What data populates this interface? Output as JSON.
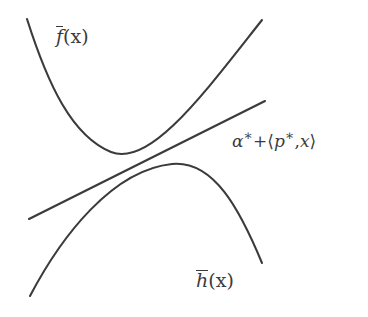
{
  "figure": {
    "background_color": "#ffffff",
    "stroke_color": "#3b3b3b",
    "stroke_width": 2.1,
    "labels": {
      "upper_curve": {
        "overline_symbol": "f",
        "argument": "(x)",
        "full_text": "f̄(x)"
      },
      "affine_line": {
        "full_text": "α* + ⟨p*, x⟩",
        "alpha": "α",
        "star1": "∗",
        "plus": "+",
        "bracket_open": "⟨",
        "p": "p",
        "star2": "∗",
        "comma": ",",
        "x": "x",
        "bracket_close": "⟩"
      },
      "lower_curve": {
        "overline_symbol": "h",
        "argument": "(x)",
        "full_text": "h̄(x)"
      }
    }
  },
  "chart_data": {
    "type": "line",
    "title": "",
    "xlabel": "",
    "ylabel": "",
    "grid": false,
    "legend_position": "inline-annotations",
    "xlim": [
      0,
      368
    ],
    "ylim": [
      317,
      0
    ],
    "series": [
      {
        "name": "f̄(x)",
        "kind": "convex-parabola",
        "path": "M 27,19 C 48,85 72,136 111,152 C 150,168 205,92 262,20",
        "vertex": [
          111,
          152
        ],
        "endpoints": [
          [
            27,
            19
          ],
          [
            262,
            20
          ]
        ]
      },
      {
        "name": "α* + ⟨p*, x⟩",
        "kind": "straight-line",
        "path": "M 29,219 L 265,101",
        "endpoints": [
          [
            29,
            219
          ],
          [
            265,
            101
          ]
        ],
        "slope": -0.5
      },
      {
        "name": "h̄(x)",
        "kind": "concave-parabola",
        "path": "M 30,296 C 62,235 113,170 172,164 C 214,160 240,210 262,263",
        "vertex": [
          172,
          164
        ],
        "endpoints": [
          [
            30,
            296
          ],
          [
            262,
            263
          ]
        ]
      }
    ]
  }
}
